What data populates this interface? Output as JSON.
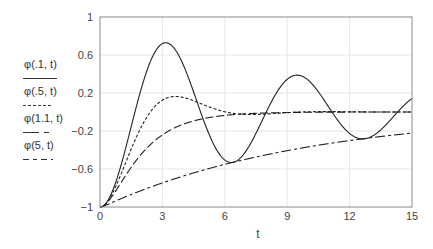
{
  "chart_data": {
    "type": "line",
    "title": "",
    "xlabel": "t",
    "ylabel": "",
    "xlim": [
      0,
      15
    ],
    "ylim": [
      -1,
      1
    ],
    "xticks": [
      0,
      3,
      6,
      9,
      12,
      15
    ],
    "yticks": [
      1,
      0.6,
      0.2,
      -0.2,
      -0.6,
      -1
    ],
    "ytick_labels": [
      "1",
      "0.6",
      "0.2",
      "-0.2",
      "-0.6",
      "-1"
    ],
    "xtick_labels": [
      "0",
      "3",
      "6",
      "9",
      "12",
      "15"
    ],
    "grid": true,
    "legend_position": "left",
    "series": [
      {
        "name": "φ(.1, t)",
        "zeta": 0.1,
        "dash": "",
        "approx_points": [
          [
            0,
            -1
          ],
          [
            1.5,
            -0.08
          ],
          [
            3,
            0.72
          ],
          [
            4.6,
            0.0
          ],
          [
            6.3,
            -0.53
          ],
          [
            8,
            0.0
          ],
          [
            9.4,
            0.39
          ],
          [
            11,
            0.0
          ],
          [
            12.5,
            -0.28
          ],
          [
            14.1,
            0.0
          ],
          [
            15,
            0.17
          ]
        ]
      },
      {
        "name": "φ(.5, t)",
        "zeta": 0.5,
        "dash": "3,2",
        "approx_points": [
          [
            0,
            -1
          ],
          [
            1,
            -0.35
          ],
          [
            2.4,
            0.16
          ],
          [
            3.6,
            0.09
          ],
          [
            5.5,
            -0.03
          ],
          [
            7.3,
            0.0
          ],
          [
            15,
            0.0
          ]
        ]
      },
      {
        "name": "φ(1.1, t)",
        "zeta": 1.1,
        "dash": "8,3",
        "approx_points": [
          [
            0,
            -1
          ],
          [
            0.5,
            -0.55
          ],
          [
            1,
            -0.2
          ],
          [
            2,
            0.05
          ],
          [
            4,
            0.01
          ],
          [
            15,
            0.0
          ]
        ]
      },
      {
        "name": "φ(5, t)",
        "zeta": 5,
        "dash": "10,3,3,3",
        "approx_points": [
          [
            0,
            -1
          ],
          [
            0.2,
            -0.3
          ],
          [
            0.5,
            -0.03
          ],
          [
            1,
            0.0
          ],
          [
            15,
            0.0
          ]
        ]
      }
    ]
  },
  "legend": {
    "items": [
      {
        "label": "φ(.1, t)"
      },
      {
        "label": "φ(.5, t)"
      },
      {
        "label": "φ(1.1, t)"
      },
      {
        "label": "φ(5, t)"
      }
    ]
  },
  "colors": {
    "axis": "#8a8a8a",
    "grid": "#e6e6e6",
    "line": "#222222",
    "text": "#444444"
  }
}
